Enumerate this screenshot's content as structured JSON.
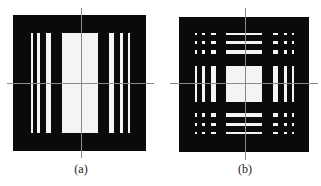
{
  "figure": {
    "panels": [
      {
        "id": "a",
        "label": "(a)",
        "description": "Black square with vertical white slit pattern (bar target, 1-D)",
        "square": {
          "x": 13,
          "y": 15,
          "w": 133,
          "h": 136
        },
        "stripes_x": [
          [
            31,
            2
          ],
          [
            37,
            3
          ],
          [
            46,
            5
          ],
          [
            62,
            36
          ],
          [
            109,
            5
          ],
          [
            120,
            3
          ],
          [
            128,
            2
          ]
        ],
        "stripes_y": [
          33,
          100
        ],
        "axis": {
          "cx": 81,
          "cy": 83,
          "x0": 7,
          "x1": 154,
          "y0": 8,
          "y1": 158
        }
      },
      {
        "id": "b",
        "label": "(b)",
        "description": "Black square with 2-D pattern: vertical bars, horizontal bars and dot grid corners",
        "square": {
          "x": 179,
          "y": 17,
          "w": 130,
          "h": 135
        },
        "axis": {
          "cx": 245,
          "cy": 83,
          "x0": 170,
          "x1": 318,
          "y0": 8,
          "y1": 160
        }
      }
    ]
  },
  "colors": {
    "background": "#ffffff",
    "mask": "#0a0a0a",
    "opening": "#f4f4f4",
    "axis": "#8a8a8a"
  }
}
